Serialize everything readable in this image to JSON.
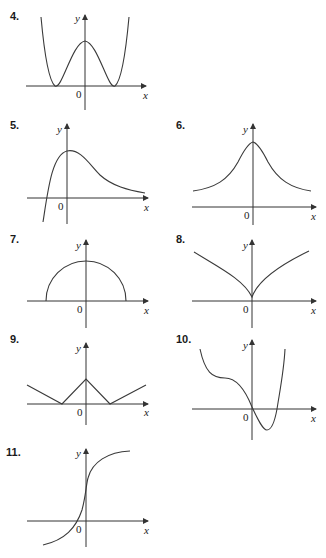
{
  "problems": [
    {
      "number": "4.",
      "x_label": "x",
      "y_label": "y",
      "origin_label": "0",
      "shape": "W-shaped quartic, local max on y-axis, two minima touching x-axis"
    },
    {
      "number": "5.",
      "x_label": "x",
      "y_label": "y",
      "origin_label": "0",
      "shape": "rises from below, peaks near y-axis, decays toward x-axis"
    },
    {
      "number": "6.",
      "x_label": "x",
      "y_label": "y",
      "origin_label": "0",
      "shape": "symmetric bell curve with peak on y-axis"
    },
    {
      "number": "7.",
      "x_label": "x",
      "y_label": "y",
      "origin_label": "0",
      "shape": "upper semicircle centered at origin"
    },
    {
      "number": "8.",
      "x_label": "x",
      "y_label": "y",
      "origin_label": "0",
      "shape": "cusp at origin, concave branches"
    },
    {
      "number": "9.",
      "x_label": "x",
      "y_label": "y",
      "origin_label": "0",
      "shape": "piecewise linear W with peak on y-axis"
    },
    {
      "number": "10.",
      "x_label": "x",
      "y_label": "y",
      "origin_label": "0",
      "shape": "decreasing with inflection plateau, dips below axis, rises"
    },
    {
      "number": "11.",
      "x_label": "x",
      "y_label": "y",
      "origin_label": "0",
      "shape": "increasing S-curve crossing near origin"
    }
  ]
}
